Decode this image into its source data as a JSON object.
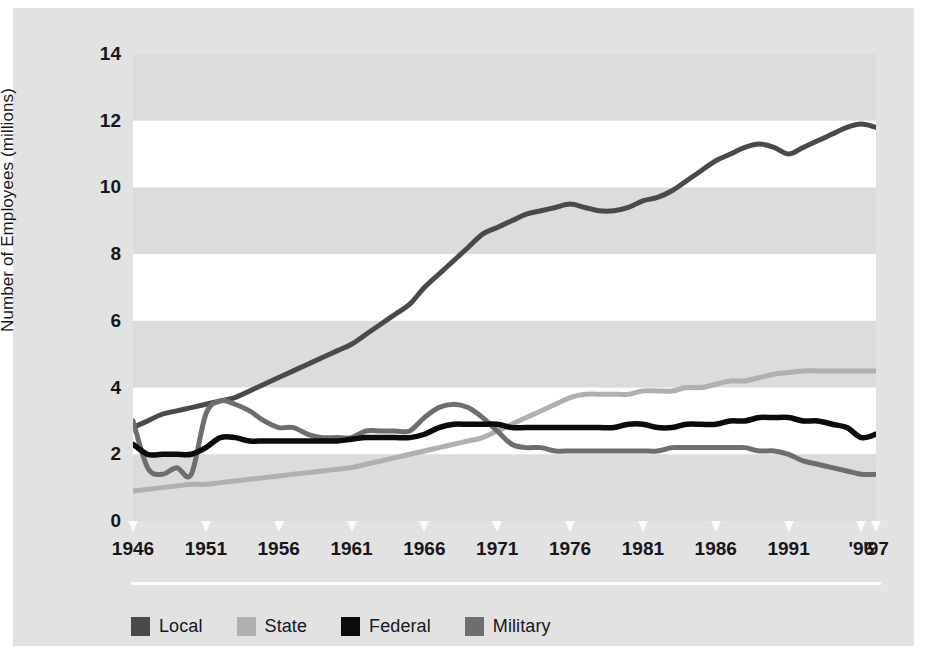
{
  "figure": {
    "background": "#e2e2e2",
    "plot_background": "#ffffff",
    "band_color": "#dcdcdc"
  },
  "axes": {
    "y_title": "Number of Employees (millions)",
    "y_ticks": [
      0,
      2,
      4,
      6,
      8,
      10,
      12,
      14
    ],
    "y_tick_labels": [
      "0",
      "2",
      "4",
      "6",
      "8",
      "10",
      "12",
      "14"
    ],
    "x_tick_labels": [
      "1946",
      "1951",
      "1956",
      "1961",
      "1966",
      "1971",
      "1976",
      "1981",
      "1986",
      "1991",
      "'96",
      "'97"
    ],
    "x_tick_years": [
      1946,
      1951,
      1956,
      1961,
      1966,
      1971,
      1976,
      1981,
      1986,
      1991,
      1996,
      1997
    ]
  },
  "legend": {
    "items": [
      {
        "label": "Local",
        "color": "#4a4a4a"
      },
      {
        "label": "State",
        "color": "#b0b0b0"
      },
      {
        "label": "Federal",
        "color": "#0b0b0b"
      },
      {
        "label": "Military",
        "color": "#6e6e6e"
      }
    ]
  },
  "chart_data": {
    "type": "line",
    "title": "",
    "subtitle": "",
    "xlabel": "",
    "ylabel": "Number of Employees (millions)",
    "xlim": [
      1946,
      1997
    ],
    "ylim": [
      0,
      14
    ],
    "grid": "horizontal-alternating-bands",
    "legend_position": "bottom-left",
    "x": [
      1946,
      1947,
      1948,
      1949,
      1950,
      1951,
      1952,
      1953,
      1954,
      1955,
      1956,
      1957,
      1958,
      1959,
      1960,
      1961,
      1962,
      1963,
      1964,
      1965,
      1966,
      1967,
      1968,
      1969,
      1970,
      1971,
      1972,
      1973,
      1974,
      1975,
      1976,
      1977,
      1978,
      1979,
      1980,
      1981,
      1982,
      1983,
      1984,
      1985,
      1986,
      1987,
      1988,
      1989,
      1990,
      1991,
      1992,
      1993,
      1994,
      1995,
      1996,
      1997
    ],
    "series": [
      {
        "name": "Local",
        "color": "#4a4a4a",
        "values": [
          2.8,
          3.0,
          3.2,
          3.3,
          3.4,
          3.5,
          3.6,
          3.7,
          3.9,
          4.1,
          4.3,
          4.5,
          4.7,
          4.9,
          5.1,
          5.3,
          5.6,
          5.9,
          6.2,
          6.5,
          7.0,
          7.4,
          7.8,
          8.2,
          8.6,
          8.8,
          9.0,
          9.2,
          9.3,
          9.4,
          9.5,
          9.4,
          9.3,
          9.3,
          9.4,
          9.6,
          9.7,
          9.9,
          10.2,
          10.5,
          10.8,
          11.0,
          11.2,
          11.3,
          11.2,
          11.0,
          11.2,
          11.4,
          11.6,
          11.8,
          11.9,
          11.8
        ]
      },
      {
        "name": "State",
        "color": "#b0b0b0",
        "values": [
          0.9,
          0.95,
          1.0,
          1.05,
          1.1,
          1.1,
          1.15,
          1.2,
          1.25,
          1.3,
          1.35,
          1.4,
          1.45,
          1.5,
          1.55,
          1.6,
          1.7,
          1.8,
          1.9,
          2.0,
          2.1,
          2.2,
          2.3,
          2.4,
          2.5,
          2.7,
          2.9,
          3.1,
          3.3,
          3.5,
          3.7,
          3.8,
          3.8,
          3.8,
          3.8,
          3.9,
          3.9,
          3.9,
          4.0,
          4.0,
          4.1,
          4.2,
          4.2,
          4.3,
          4.4,
          4.45,
          4.5,
          4.5,
          4.5,
          4.5,
          4.5,
          4.5
        ]
      },
      {
        "name": "Federal",
        "color": "#0b0b0b",
        "values": [
          2.3,
          2.0,
          2.0,
          2.0,
          2.0,
          2.2,
          2.5,
          2.5,
          2.4,
          2.4,
          2.4,
          2.4,
          2.4,
          2.4,
          2.4,
          2.45,
          2.5,
          2.5,
          2.5,
          2.5,
          2.6,
          2.8,
          2.9,
          2.9,
          2.9,
          2.9,
          2.8,
          2.8,
          2.8,
          2.8,
          2.8,
          2.8,
          2.8,
          2.8,
          2.9,
          2.9,
          2.8,
          2.8,
          2.9,
          2.9,
          2.9,
          3.0,
          3.0,
          3.1,
          3.1,
          3.1,
          3.0,
          3.0,
          2.9,
          2.8,
          2.5,
          2.6
        ]
      },
      {
        "name": "Military",
        "color": "#6e6e6e",
        "values": [
          3.0,
          1.6,
          1.4,
          1.6,
          1.4,
          3.2,
          3.6,
          3.5,
          3.3,
          3.0,
          2.8,
          2.8,
          2.6,
          2.5,
          2.5,
          2.5,
          2.7,
          2.7,
          2.7,
          2.7,
          3.1,
          3.4,
          3.5,
          3.4,
          3.1,
          2.7,
          2.3,
          2.2,
          2.2,
          2.1,
          2.1,
          2.1,
          2.1,
          2.1,
          2.1,
          2.1,
          2.1,
          2.2,
          2.2,
          2.2,
          2.2,
          2.2,
          2.2,
          2.1,
          2.1,
          2.0,
          1.8,
          1.7,
          1.6,
          1.5,
          1.4,
          1.4
        ]
      }
    ],
    "notes": [
      "Military line shows post-WWII demobilization dip 1947-1950, Korean War peak 1952, Vietnam peak 1968, and post-Cold War decline after 1990.",
      "Military series drops to about 0.9 near 1995 with a small rebound spike near '96 before falling again at '97 in the rendered trace."
    ]
  }
}
